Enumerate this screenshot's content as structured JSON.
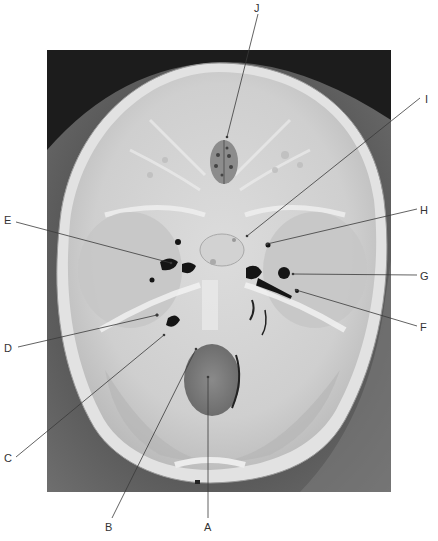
{
  "figure": {
    "photo": {
      "x": 47,
      "y": 50,
      "width": 344,
      "height": 442
    },
    "colors": {
      "background": "#2b2b2b",
      "bone_light": "#d8d8d8",
      "bone_mid": "#bdbdbd",
      "shadow": "#4a4a4a",
      "foramen": "#1a1a1a",
      "leader_line": "#333333",
      "label_text": "#333333"
    }
  },
  "labels": [
    {
      "id": "A",
      "text": "A",
      "label_x": 204,
      "label_y": 521,
      "target_x": 208,
      "target_y": 377
    },
    {
      "id": "B",
      "text": "B",
      "label_x": 105,
      "label_y": 521,
      "target_x": 196,
      "target_y": 349
    },
    {
      "id": "C",
      "text": "C",
      "label_x": 4,
      "label_y": 452,
      "target_x": 164,
      "target_y": 335
    },
    {
      "id": "D",
      "text": "D",
      "label_x": 4,
      "label_y": 342,
      "target_x": 157,
      "target_y": 315
    },
    {
      "id": "E",
      "text": "E",
      "label_x": 4,
      "label_y": 214,
      "target_x": 171,
      "target_y": 263
    },
    {
      "id": "F",
      "text": "F",
      "label_x": 420,
      "label_y": 321,
      "target_x": 296,
      "target_y": 290
    },
    {
      "id": "G",
      "text": "G",
      "label_x": 420,
      "label_y": 270,
      "target_x": 293,
      "target_y": 274
    },
    {
      "id": "H",
      "text": "H",
      "label_x": 420,
      "label_y": 204,
      "target_x": 267,
      "target_y": 244
    },
    {
      "id": "I",
      "text": "I",
      "label_x": 425,
      "label_y": 93,
      "target_x": 247,
      "target_y": 236
    },
    {
      "id": "J",
      "text": "J",
      "label_x": 254,
      "label_y": 2,
      "target_x": 227,
      "target_y": 137
    }
  ]
}
